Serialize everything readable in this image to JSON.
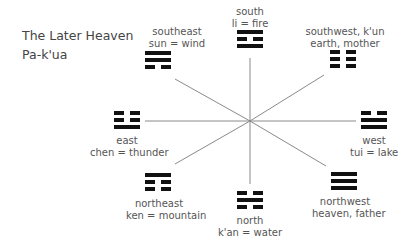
{
  "title": {
    "line1": "The Later Heaven",
    "line2": "Pa-k'ua"
  },
  "trigrams": [
    {
      "id": "south",
      "direction": "south",
      "meaning": "li = fire",
      "lines": [
        "solid",
        "broken",
        "solid"
      ]
    },
    {
      "id": "southeast",
      "direction": "southeast",
      "meaning": "sun = wind",
      "lines": [
        "solid",
        "solid",
        "broken"
      ]
    },
    {
      "id": "southwest",
      "direction": "southwest, k'un",
      "meaning": "earth, mother",
      "lines": [
        "broken",
        "broken",
        "broken"
      ]
    },
    {
      "id": "east",
      "direction": "east",
      "meaning": "chen = thunder",
      "lines": [
        "broken",
        "broken",
        "solid"
      ]
    },
    {
      "id": "west",
      "direction": "west",
      "meaning": "tui = lake",
      "lines": [
        "broken",
        "solid",
        "solid"
      ]
    },
    {
      "id": "northeast",
      "direction": "northeast",
      "meaning": "ken = mountain",
      "lines": [
        "solid",
        "broken",
        "broken"
      ]
    },
    {
      "id": "north",
      "direction": "north",
      "meaning": "k'an = water",
      "lines": [
        "broken",
        "solid",
        "broken"
      ]
    },
    {
      "id": "northwest",
      "direction": "northwest",
      "meaning": "heaven, father",
      "lines": [
        "solid",
        "solid",
        "solid"
      ]
    }
  ]
}
